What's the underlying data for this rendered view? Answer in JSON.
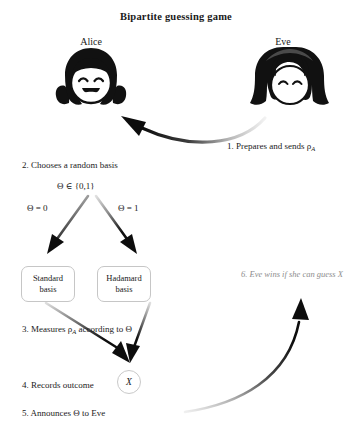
{
  "title": "Bipartite guessing game",
  "actors": {
    "alice": {
      "name": "Alice",
      "avatar_icon": "alice-face-pigtails-icon"
    },
    "eve": {
      "name": "Eve",
      "avatar_icon": "eve-face-longhair-icon"
    }
  },
  "steps": {
    "step1": "1. Prepares and sends ρ",
    "step1_sub": "A",
    "step2": "2. Chooses a random basis",
    "theta_set": "Θ ∈ {0,1}",
    "branch_zero": "Θ = 0",
    "branch_one": "Θ = 1",
    "step3_pre": "3. Measures ρ",
    "step3_sub": "A",
    "step3_post": " according to Θ",
    "step4": "4. Records outcome",
    "step5": "5. Announces Θ to Eve",
    "step6": "6. Eve wins if she can guess X"
  },
  "boxes": {
    "standard": "Standard basis",
    "standard_line1": "Standard",
    "standard_line2": "basis",
    "hadamard": "Hadamard basis",
    "hadamard_line1": "Hadamard",
    "hadamard_line2": "basis"
  },
  "outcome": {
    "symbol": "X"
  },
  "arrows": {
    "eve_to_alice": "curved-arrow-eve-to-alice",
    "branch_left": "arrow-to-standard-basis",
    "branch_right": "arrow-to-hadamard-basis",
    "merge_left": "arrow-standard-to-outcome",
    "merge_right": "arrow-hadamard-to-outcome",
    "alice_to_eve": "curved-arrow-alice-to-eve"
  },
  "colors": {
    "ink": "#1a1a1a",
    "box_border": "#c6c6c6",
    "muted_text": "#8d8d8d",
    "arrow_dark": "#111111",
    "arrow_light": "#e8e8e8"
  }
}
